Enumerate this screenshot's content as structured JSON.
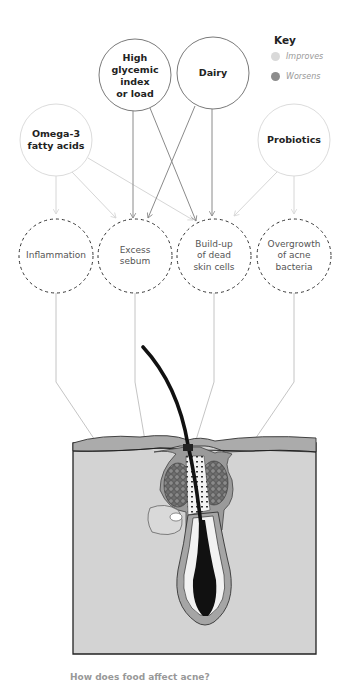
{
  "key": {
    "title": "Key",
    "items": [
      {
        "label": "Improves",
        "color": "#d9d9d9"
      },
      {
        "label": "Worsens",
        "color": "#8c8c8c"
      }
    ]
  },
  "factors": [
    {
      "id": "omega3",
      "lines": [
        "Omega-3",
        "fatty acids"
      ],
      "label": "Omega-3 fatty acids",
      "effect": "improves"
    },
    {
      "id": "glycemic",
      "lines": [
        "High",
        "glycemic",
        "index",
        "or load"
      ],
      "label": "High glycemic index or load",
      "effect": "worsens"
    },
    {
      "id": "dairy",
      "lines": [
        "Dairy"
      ],
      "label": "Dairy",
      "effect": "worsens"
    },
    {
      "id": "probiotics",
      "lines": [
        "Probiotics"
      ],
      "label": "Probiotics",
      "effect": "improves"
    }
  ],
  "effects": [
    {
      "id": "inflammation",
      "lines": [
        "Inflammation"
      ],
      "label": "Inflammation"
    },
    {
      "id": "sebum",
      "lines": [
        "Excess",
        "sebum"
      ],
      "label": "Excess sebum"
    },
    {
      "id": "buildup",
      "lines": [
        "Build-up",
        "of dead",
        "skin cells"
      ],
      "label": "Build-up of dead skin cells"
    },
    {
      "id": "bacteria",
      "lines": [
        "Overgrowth",
        "of acne",
        "bacteria"
      ],
      "label": "Overgrowth of acne bacteria"
    }
  ],
  "connections": [
    {
      "from": "omega3",
      "to": "inflammation",
      "effect": "improves"
    },
    {
      "from": "omega3",
      "to": "sebum",
      "effect": "improves"
    },
    {
      "from": "omega3",
      "to": "buildup",
      "effect": "improves"
    },
    {
      "from": "glycemic",
      "to": "sebum",
      "effect": "worsens"
    },
    {
      "from": "glycemic",
      "to": "buildup",
      "effect": "worsens"
    },
    {
      "from": "dairy",
      "to": "sebum",
      "effect": "worsens"
    },
    {
      "from": "dairy",
      "to": "buildup",
      "effect": "worsens"
    },
    {
      "from": "probiotics",
      "to": "buildup",
      "effect": "improves"
    },
    {
      "from": "probiotics",
      "to": "bacteria",
      "effect": "improves"
    }
  ],
  "colors": {
    "improves_line": "#d6d6d6",
    "worsens_line": "#8a8a8a",
    "skin_fill": "#d3d3d3",
    "epidermis": "#a9a9a9",
    "outline": "#222222"
  },
  "caption": "How does food affect acne?"
}
